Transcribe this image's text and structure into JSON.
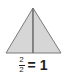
{
  "diagram": {
    "shape": "triangle",
    "parts": 2,
    "shaded_parts": 2,
    "fill_color": "#d6d6d6",
    "stroke_color": "#7a7a7a"
  },
  "caption": {
    "numerator": "2",
    "denominator": "2",
    "equals": "= 1"
  }
}
